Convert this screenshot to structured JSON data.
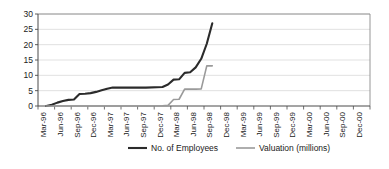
{
  "chart_data": {
    "type": "line",
    "title": "",
    "subtitle": "",
    "xlabel": "",
    "ylabel": "",
    "ylim": [
      0,
      30
    ],
    "yticks": [
      0,
      5,
      10,
      15,
      20,
      25,
      30
    ],
    "grid": true,
    "legend_position": "bottom",
    "categories": [
      "Mar-96",
      "Jun-96",
      "Sep-96",
      "Dec-96",
      "Mar-97",
      "Jun-97",
      "Sep-97",
      "Dec-97",
      "Mar-98",
      "Jun-98",
      "Sep-98",
      "Dec-98",
      "Mar-99",
      "Jun-99",
      "Sep-99",
      "Dec-99",
      "Mar-00",
      "Jun-00",
      "Sep-00",
      "Dec-00"
    ],
    "series": [
      {
        "name": "No. of Employees",
        "color": "#2b2b2b",
        "width": 2.1,
        "x": [
          "Mar-96",
          "Apr-96",
          "May-96",
          "Jun-96",
          "Jul-96",
          "Aug-96",
          "Sep-96",
          "Oct-96",
          "Nov-96",
          "Dec-96",
          "Jan-97",
          "Feb-97",
          "Mar-97",
          "Jun-97",
          "Sep-97",
          "Dec-97",
          "Jan-98",
          "Feb-98",
          "Mar-98",
          "Apr-98",
          "May-98",
          "Jun-98",
          "Jul-98",
          "Aug-98",
          "Sep-98"
        ],
        "values": [
          0,
          0.4,
          1.1,
          1.6,
          2.0,
          2.1,
          3.9,
          4.0,
          4.2,
          4.6,
          5.1,
          5.6,
          6.0,
          6.0,
          6.0,
          6.2,
          7.0,
          8.6,
          8.7,
          10.8,
          11.0,
          12.6,
          15.4,
          20.3,
          27.0
        ]
      },
      {
        "name": "Valuation (millions)",
        "color": "#9a9a9a",
        "width": 1.6,
        "x": [
          "Mar-96",
          "Jun-96",
          "Sep-96",
          "Dec-96",
          "Mar-97",
          "Jun-97",
          "Sep-97",
          "Dec-97",
          "Jan-98",
          "Feb-98",
          "Mar-98",
          "Apr-98",
          "May-98",
          "Jun-98",
          "Jul-98",
          "Aug-98",
          "Sep-98"
        ],
        "values": [
          0,
          0,
          0,
          0,
          0,
          0,
          0,
          0.1,
          0.2,
          2.1,
          2.2,
          5.5,
          5.5,
          5.5,
          5.6,
          13.1,
          13.1
        ]
      }
    ]
  },
  "legend": {
    "items": [
      {
        "label": "No. of Employees",
        "color": "#2b2b2b",
        "width": 2.1
      },
      {
        "label": "Valuation (millions)",
        "color": "#9a9a9a",
        "width": 1.6
      }
    ]
  }
}
